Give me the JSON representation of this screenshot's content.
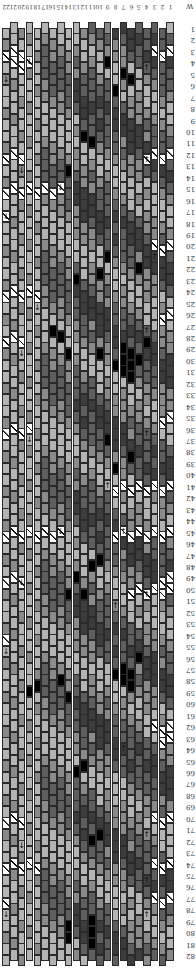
{
  "chart": {
    "orientation": "rotated-180",
    "columns": 22,
    "rows": 82,
    "corner_label": "W",
    "column_labels": [
      "1",
      "2",
      "3",
      "4",
      "5",
      "6",
      "7",
      "8",
      "9",
      "10",
      "11",
      "12",
      "13",
      "14",
      "15",
      "16",
      "17",
      "18",
      "19",
      "20",
      "21",
      "22"
    ],
    "row_labels": [
      "1",
      "2",
      "3",
      "4",
      "5",
      "6",
      "7",
      "8",
      "9",
      "10",
      "11",
      "12",
      "13",
      "14",
      "15",
      "16",
      "17",
      "18",
      "19",
      "20",
      "21",
      "22",
      "23",
      "24",
      "25",
      "26",
      "27",
      "28",
      "29",
      "30",
      "31",
      "32",
      "33",
      "34",
      "35",
      "36",
      "37",
      "38",
      "39",
      "40",
      "41",
      "42",
      "43",
      "44",
      "45",
      "46",
      "47",
      "48",
      "49",
      "50",
      "51",
      "52",
      "53",
      "54",
      "55",
      "56",
      "57",
      "58",
      "59",
      "60",
      "61",
      "62",
      "63",
      "64",
      "65",
      "66",
      "67",
      "68",
      "69",
      "70",
      "71",
      "72",
      "73",
      "74",
      "75",
      "76",
      "77",
      "78",
      "79",
      "80",
      "81",
      "82"
    ],
    "colors": {
      "light": "#b4b4b4",
      "mid": "#8a8a8a",
      "dark": "#5e5e5e",
      "darker": "#3c3c3c",
      "black": "#000000",
      "border": "#2a2a2a",
      "turn_bg": "#ffffff"
    },
    "icons": {
      "turn_marker": "diagonal-slash",
      "arrow_up": "↑",
      "arrow_down": "↓"
    },
    "turn_markers": [
      {
        "row": 3,
        "cols": [
          1,
          2,
          3
        ]
      },
      {
        "row": 3,
        "cols": [
          20,
          21,
          22
        ]
      },
      {
        "row": 4,
        "cols": [
          19,
          20,
          21
        ]
      },
      {
        "row": 12,
        "cols": [
          1,
          2,
          3,
          4
        ]
      },
      {
        "row": 12,
        "cols": [
          20,
          21,
          22
        ]
      },
      {
        "row": 15,
        "cols": [
          15,
          16,
          17,
          18,
          19,
          20,
          21,
          22
        ]
      },
      {
        "row": 17,
        "cols": [
          22
        ]
      },
      {
        "row": 20,
        "cols": [
          1,
          2,
          3
        ]
      },
      {
        "row": 24,
        "cols": [
          18,
          19,
          20,
          21,
          22
        ]
      },
      {
        "row": 26,
        "cols": [
          1,
          2
        ]
      },
      {
        "row": 28,
        "cols": [
          20,
          21,
          22
        ]
      },
      {
        "row": 35,
        "cols": [
          1,
          2
        ]
      },
      {
        "row": 36,
        "cols": [
          19,
          20,
          21,
          22
        ]
      },
      {
        "row": 41,
        "cols": [
          1,
          2,
          3,
          4,
          5,
          6,
          7,
          8
        ]
      },
      {
        "row": 45,
        "cols": [
          1,
          2,
          3,
          4,
          5,
          6,
          7,
          8,
          15,
          16,
          17,
          18,
          19,
          20,
          21,
          22
        ]
      },
      {
        "row": 49,
        "cols": [
          1,
          2
        ]
      },
      {
        "row": 49,
        "cols": [
          20,
          21,
          22
        ]
      },
      {
        "row": 50,
        "cols": [
          1,
          2,
          3,
          4,
          5,
          6
        ]
      },
      {
        "row": 54,
        "cols": [
          22
        ]
      },
      {
        "row": 62,
        "cols": [
          1,
          2,
          3
        ]
      },
      {
        "row": 63,
        "cols": [
          1,
          2
        ]
      },
      {
        "row": 70,
        "cols": [
          1,
          2,
          3
        ]
      },
      {
        "row": 70,
        "cols": [
          20,
          21,
          22
        ]
      },
      {
        "row": 74,
        "cols": [
          1,
          2,
          3
        ]
      },
      {
        "row": 74,
        "cols": [
          18,
          19,
          20,
          21,
          22
        ]
      },
      {
        "row": 77,
        "cols": [
          1,
          2,
          3
        ]
      },
      {
        "row": 77,
        "cols": [
          22
        ]
      }
    ],
    "arrows": [
      {
        "row": 4,
        "col": 4,
        "dir": "up"
      },
      {
        "row": 4,
        "col": 19,
        "dir": "down"
      },
      {
        "row": 5,
        "col": 22,
        "dir": "down"
      },
      {
        "row": 12,
        "col": 4,
        "dir": "up"
      },
      {
        "row": 13,
        "col": 20,
        "dir": "down"
      },
      {
        "row": 15,
        "col": 15,
        "dir": "down"
      },
      {
        "row": 17,
        "col": 22,
        "dir": "down"
      },
      {
        "row": 21,
        "col": 3,
        "dir": "up"
      },
      {
        "row": 25,
        "col": 18,
        "dir": "down"
      },
      {
        "row": 27,
        "col": 4,
        "dir": "up"
      },
      {
        "row": 29,
        "col": 20,
        "dir": "down"
      },
      {
        "row": 36,
        "col": 4,
        "dir": "up"
      },
      {
        "row": 37,
        "col": 19,
        "dir": "down"
      },
      {
        "row": 41,
        "col": 9,
        "dir": "up"
      },
      {
        "row": 45,
        "col": 7,
        "dir": "up"
      },
      {
        "row": 45,
        "col": 15,
        "dir": "down"
      },
      {
        "row": 49,
        "col": 20,
        "dir": "down"
      },
      {
        "row": 50,
        "col": 4,
        "dir": "up"
      },
      {
        "row": 51,
        "col": 8,
        "dir": "up"
      },
      {
        "row": 55,
        "col": 22,
        "dir": "down"
      },
      {
        "row": 64,
        "col": 7,
        "dir": "up"
      },
      {
        "row": 71,
        "col": 4,
        "dir": "up"
      },
      {
        "row": 72,
        "col": 20,
        "dir": "down"
      },
      {
        "row": 75,
        "col": 4,
        "dir": "up"
      },
      {
        "row": 78,
        "col": 4,
        "dir": "up"
      },
      {
        "row": 78,
        "col": 22,
        "dir": "down"
      }
    ],
    "motifs": [
      {
        "row": 5,
        "col": 6,
        "shade": "black"
      },
      {
        "row": 5,
        "col": 7,
        "shade": "black"
      },
      {
        "row": 4,
        "col": 9,
        "shade": "black"
      },
      {
        "row": 6,
        "col": 8,
        "shade": "black"
      },
      {
        "row": 10,
        "col": 12,
        "shade": "black"
      },
      {
        "row": 11,
        "col": 11,
        "shade": "black"
      },
      {
        "row": 13,
        "col": 14,
        "shade": "black"
      },
      {
        "row": 21,
        "col": 9,
        "shade": "black"
      },
      {
        "row": 22,
        "col": 10,
        "shade": "black"
      },
      {
        "row": 22,
        "col": 5,
        "shade": "black"
      },
      {
        "row": 23,
        "col": 13,
        "shade": "black"
      },
      {
        "row": 28,
        "col": 4,
        "shade": "black"
      },
      {
        "row": 29,
        "col": 6,
        "shade": "black"
      },
      {
        "row": 29,
        "col": 7,
        "shade": "black"
      },
      {
        "row": 30,
        "col": 5,
        "shade": "black"
      },
      {
        "row": 30,
        "col": 6,
        "shade": "black"
      },
      {
        "row": 30,
        "col": 7,
        "shade": "black"
      },
      {
        "row": 30,
        "col": 8,
        "shade": "black"
      },
      {
        "row": 31,
        "col": 6,
        "shade": "black"
      },
      {
        "row": 31,
        "col": 7,
        "shade": "black"
      },
      {
        "row": 29,
        "col": 10,
        "shade": "black"
      },
      {
        "row": 29,
        "col": 14,
        "shade": "black"
      },
      {
        "row": 28,
        "col": 15,
        "shade": "black"
      },
      {
        "row": 27,
        "col": 16,
        "shade": "black"
      },
      {
        "row": 38,
        "col": 6,
        "shade": "black"
      },
      {
        "row": 39,
        "col": 8,
        "shade": "black"
      },
      {
        "row": 37,
        "col": 9,
        "shade": "black"
      },
      {
        "row": 47,
        "col": 10,
        "shade": "black"
      },
      {
        "row": 48,
        "col": 11,
        "shade": "black"
      },
      {
        "row": 49,
        "col": 13,
        "shade": "black"
      },
      {
        "row": 50,
        "col": 12,
        "shade": "black"
      },
      {
        "row": 50,
        "col": 14,
        "shade": "black"
      },
      {
        "row": 56,
        "col": 5,
        "shade": "black"
      },
      {
        "row": 57,
        "col": 6,
        "shade": "black"
      },
      {
        "row": 57,
        "col": 7,
        "shade": "black"
      },
      {
        "row": 57,
        "col": 8,
        "shade": "black"
      },
      {
        "row": 58,
        "col": 6,
        "shade": "black"
      },
      {
        "row": 58,
        "col": 7,
        "shade": "black"
      },
      {
        "row": 59,
        "col": 19,
        "shade": "black"
      },
      {
        "row": 58,
        "col": 18,
        "shade": "black"
      },
      {
        "row": 58,
        "col": 15,
        "shade": "black"
      },
      {
        "row": 59,
        "col": 14,
        "shade": "black"
      },
      {
        "row": 65,
        "col": 12,
        "shade": "black"
      },
      {
        "row": 66,
        "col": 13,
        "shade": "black"
      },
      {
        "row": 71,
        "col": 10,
        "shade": "black"
      },
      {
        "row": 72,
        "col": 11,
        "shade": "black"
      },
      {
        "row": 79,
        "col": 14,
        "shade": "black"
      },
      {
        "row": 80,
        "col": 14,
        "shade": "black"
      },
      {
        "row": 80,
        "col": 11,
        "shade": "black"
      },
      {
        "row": 81,
        "col": 11,
        "shade": "black"
      },
      {
        "row": 79,
        "col": 11,
        "shade": "black"
      }
    ]
  }
}
